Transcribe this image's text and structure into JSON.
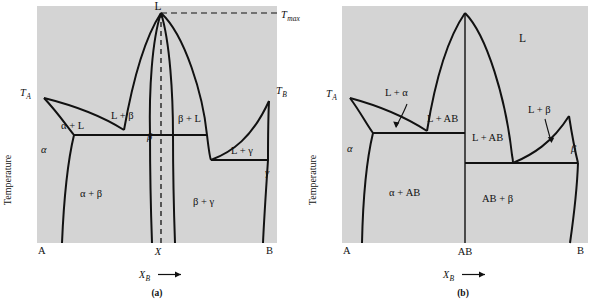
{
  "figure": {
    "background_color": "#ffffff",
    "plot_fill": "#d4d4d4",
    "line_color": "#111111",
    "y_axis_label": "Temperature",
    "x_axis_label_main": "X",
    "x_axis_label_sub": "B",
    "x_axis_arrow": "→"
  },
  "panel_a": {
    "caption": "(a)",
    "labels": {
      "liquid_apex": "L",
      "tmax_main": "T",
      "tmax_sub": "max",
      "ta_main": "T",
      "ta_sub": "A",
      "tb_main": "T",
      "tb_sub": "B",
      "alpha": "α",
      "alpha_plus_L": "α + L",
      "L_plus_beta": "L + β",
      "beta_top": "β",
      "beta_plus_L": "β + L",
      "L_plus_gamma": "L + γ",
      "gamma": "γ",
      "alpha_plus_beta": "α + β",
      "beta_plus_gamma": "β + γ",
      "corner_A": "A",
      "corner_B": "B",
      "composition_X": "X"
    }
  },
  "panel_b": {
    "caption": "(b)",
    "labels": {
      "liquid": "L",
      "ta_main": "T",
      "ta_sub": "A",
      "alpha": "α",
      "beta": "β",
      "L_plus_alpha": "L + α",
      "L_plus_beta": "L + β",
      "L_plus_AB_left": "L + AB",
      "L_plus_AB_mid": "L + AB",
      "alpha_plus_AB": "α + AB",
      "AB_plus_beta": "AB + β",
      "corner_A": "A",
      "corner_B": "B",
      "composition_AB": "AB"
    }
  }
}
